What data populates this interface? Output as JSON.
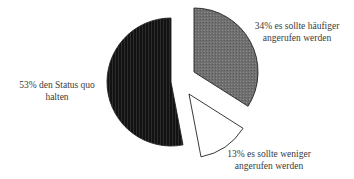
{
  "chart_data": {
    "type": "pie",
    "title": "",
    "start": "top",
    "direction": "clockwise",
    "exploded": true,
    "slices": [
      {
        "key": "more_often",
        "value": 34,
        "percent_label": "34%",
        "label_line1": "34% es sollte häufiger",
        "label_line2": "angerufen werden",
        "fill": "#6e6e6e",
        "pattern": "fine-dots-gray"
      },
      {
        "key": "less_often",
        "value": 13,
        "percent_label": "13%",
        "label_line1": "13% es sollte weniger",
        "label_line2": "angerufen werden",
        "fill": "#ffffff",
        "pattern": "none"
      },
      {
        "key": "status_quo",
        "value": 53,
        "percent_label": "53%",
        "label_line1": "53% den Status quo",
        "label_line2": "halten",
        "fill": "#151515",
        "pattern": "vertical-lines-dark"
      }
    ],
    "legend": "none",
    "labels_position": "outside"
  }
}
